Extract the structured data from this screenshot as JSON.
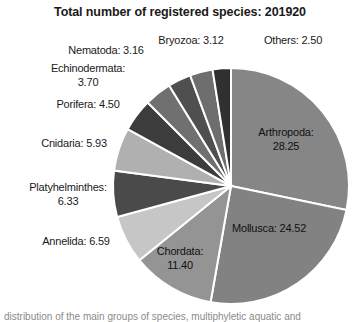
{
  "chart_data": {
    "type": "pie",
    "title": "Total number of registered species: 201920",
    "total": 201920,
    "unit": "percent",
    "legend": "none",
    "start_angle_deg": 0,
    "direction": "clockwise",
    "categories": [
      "Arthropoda",
      "Mollusca",
      "Chordata",
      "Annelida",
      "Platyhelminthes",
      "Cnidaria",
      "Porifera",
      "Echinodermata",
      "Nematoda",
      "Bryozoa",
      "Others"
    ],
    "values": [
      28.25,
      24.52,
      11.4,
      6.59,
      6.33,
      5.93,
      4.5,
      3.7,
      3.16,
      3.12,
      2.5
    ],
    "slices": [
      {
        "name": "Arthropoda",
        "value": 28.25,
        "label": "Arthropoda:\n28.25",
        "color": "#868686",
        "placement": "inside"
      },
      {
        "name": "Mollusca",
        "value": 24.52,
        "label": "Mollusca: 24.52",
        "color": "#828282",
        "placement": "inside"
      },
      {
        "name": "Chordata",
        "value": 11.4,
        "label": "Chordata:\n11.40",
        "color": "#949494",
        "placement": "inside"
      },
      {
        "name": "Annelida",
        "value": 6.59,
        "label": "Annelida: 6.59",
        "color": "#c6c6c6",
        "placement": "outside"
      },
      {
        "name": "Platyhelminthes",
        "value": 6.33,
        "label": "Platyhelminthes:\n6.33",
        "color": "#4a4a4a",
        "placement": "outside"
      },
      {
        "name": "Cnidaria",
        "value": 5.93,
        "label": "Cnidaria: 5.93",
        "color": "#b0b0b0",
        "placement": "outside"
      },
      {
        "name": "Porifera",
        "value": 4.5,
        "label": "Porifera: 4.50",
        "color": "#3c3c3c",
        "placement": "outside"
      },
      {
        "name": "Echinodermata",
        "value": 3.7,
        "label": "Echinodermata:\n3.70",
        "color": "#707070",
        "placement": "outside"
      },
      {
        "name": "Nematoda",
        "value": 3.16,
        "label": "Nematoda: 3.16",
        "color": "#4f4f4f",
        "placement": "outside"
      },
      {
        "name": "Bryozoa",
        "value": 3.12,
        "label": "Bryozoa: 3.12",
        "color": "#6e6e6e",
        "placement": "outside"
      },
      {
        "name": "Others",
        "value": 2.5,
        "label": "Others: 2.50",
        "color": "#303030",
        "placement": "outside"
      }
    ],
    "slice_border_color": "#ffffff",
    "background": "#ffffff"
  },
  "caption": {
    "text": "distribution of the main groups of species, multiphyletic aquatic and"
  }
}
